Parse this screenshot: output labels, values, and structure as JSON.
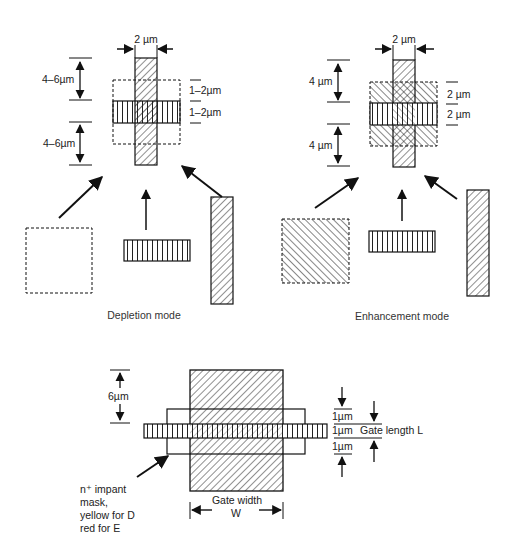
{
  "depletion": {
    "caption": "Depletion mode",
    "gate_width": "2 µm",
    "upper_extent": "4–6µm",
    "lower_extent": "4–6µm",
    "overlap_top": "1–2µm",
    "overlap_bottom": "1–2µm"
  },
  "enhancement": {
    "caption": "Enhancement mode",
    "gate_width": "2 µm",
    "upper_extent": "4 µm",
    "lower_extent": "4 µm",
    "overlap_top": "2 µm",
    "overlap_bottom": "2 µm"
  },
  "combined": {
    "gate_extension": "6µm",
    "dim_top": "1µm",
    "dim_mid": "1µm",
    "dim_bottom": "1µm",
    "gate_length_label": "Gate length L",
    "gate_width_label": "Gate width",
    "gate_width_symbol": "W",
    "mask_note": [
      "n⁺ impant",
      "mask,",
      "yellow for D",
      "red for E"
    ]
  }
}
